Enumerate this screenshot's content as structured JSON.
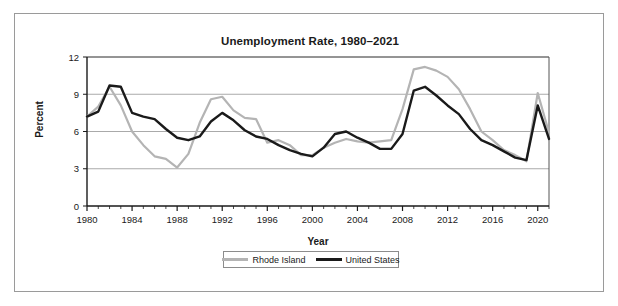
{
  "chart_data": {
    "type": "line",
    "title": "Unemployment Rate, 1980–2021",
    "xlabel": "Year",
    "ylabel": "Percent",
    "xlim": [
      1980,
      2021
    ],
    "ylim": [
      0,
      12
    ],
    "yticks": [
      0,
      3,
      6,
      9,
      12
    ],
    "xticks": [
      1980,
      1984,
      1988,
      1992,
      1996,
      2000,
      2004,
      2008,
      2012,
      2016,
      2020
    ],
    "xtick_labels": [
      "1980",
      "1984",
      "1988",
      "1992",
      "1996",
      "2000",
      "2004",
      "2008",
      "2012",
      "2016",
      "2020"
    ],
    "ytick_labels": [
      "0",
      "3",
      "6",
      "9",
      "12"
    ],
    "grid": "horizontal",
    "legend_position": "bottom-center",
    "x": [
      1980,
      1981,
      1982,
      1983,
      1984,
      1985,
      1986,
      1987,
      1988,
      1989,
      1990,
      1991,
      1992,
      1993,
      1994,
      1995,
      1996,
      1997,
      1998,
      1999,
      2000,
      2001,
      2002,
      2003,
      2004,
      2005,
      2006,
      2007,
      2008,
      2009,
      2010,
      2011,
      2012,
      2013,
      2014,
      2015,
      2016,
      2017,
      2018,
      2019,
      2020,
      2021
    ],
    "series": [
      {
        "name": "Rhode Island",
        "color": "#b4b4b4",
        "values": [
          7.2,
          8.0,
          9.6,
          8.1,
          6.0,
          4.9,
          4.0,
          3.8,
          3.1,
          4.2,
          6.7,
          8.6,
          8.8,
          7.7,
          7.1,
          7.0,
          5.1,
          5.3,
          4.9,
          4.1,
          4.1,
          4.7,
          5.1,
          5.4,
          5.2,
          5.1,
          5.2,
          5.3,
          7.8,
          11.0,
          11.2,
          10.9,
          10.4,
          9.4,
          7.8,
          6.0,
          5.3,
          4.5,
          4.1,
          3.6,
          9.1,
          5.9
        ]
      },
      {
        "name": "United States",
        "color": "#1a1a1a",
        "values": [
          7.2,
          7.6,
          9.7,
          9.6,
          7.5,
          7.2,
          7.0,
          6.2,
          5.5,
          5.3,
          5.6,
          6.8,
          7.5,
          6.9,
          6.1,
          5.6,
          5.4,
          4.9,
          4.5,
          4.2,
          4.0,
          4.7,
          5.8,
          6.0,
          5.5,
          5.1,
          4.6,
          4.6,
          5.8,
          9.3,
          9.6,
          8.9,
          8.1,
          7.4,
          6.2,
          5.3,
          4.9,
          4.4,
          3.9,
          3.7,
          8.1,
          5.4
        ]
      }
    ]
  },
  "legend": {
    "items": [
      {
        "label": "Rhode Island",
        "color": "#b4b4b4"
      },
      {
        "label": "United States",
        "color": "#1a1a1a"
      }
    ]
  }
}
